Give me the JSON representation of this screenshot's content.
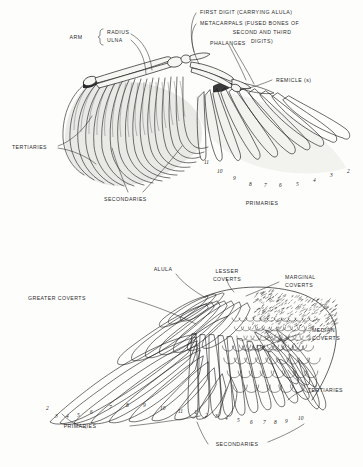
{
  "document": {
    "title": "Bird Wing Anatomy — Feather Tracts and Skeleton",
    "figure_count": 2,
    "ink_color": "#1d1d1d",
    "paper_color": "#fdfdfc"
  },
  "figures": [
    {
      "id": "upper-wing-skeleton",
      "caption": "Spread wing showing underlying skeleton and flight feathers",
      "labels": {
        "arm": "ARM",
        "radius": "RADIUS",
        "ulna": "ULNA",
        "first_digit": "FIRST DIGIT (CARRYING ALULA)",
        "metacarpals_line1": "METACARPALS (FUSED BONES OF",
        "metacarpals_line2": "SECOND AND THIRD",
        "metacarpals_line3": "DIGITS)",
        "phalanges": "PHALANGES",
        "remicle": "REMICLE (s)",
        "tertiaries": "TERTIARIES",
        "secondaries": "SECONDARIES",
        "primaries": "PRIMARIES"
      },
      "primary_numbers": [
        "11",
        "10",
        "9",
        "8",
        "7",
        "6",
        "5",
        "4",
        "3",
        "2"
      ]
    },
    {
      "id": "lower-wing-coverts",
      "caption": "Upper surface of wing showing covert feather tracts",
      "labels": {
        "alula": "ALULA",
        "lesser_coverts_line1": "LESSER",
        "lesser_coverts_line2": "COVERTS",
        "marginal_coverts_line1": "MARGINAL",
        "marginal_coverts_line2": "COVERTS",
        "greater_coverts": "GREATER  COVERTS",
        "median_coverts_line1": "MEDIAN",
        "median_coverts_line2": "COVERTS",
        "tertiaries": "TERTIARIES",
        "primaries": "PRIMARIES",
        "secondaries": "SECONDARIES"
      },
      "primary_numbers": [
        "2",
        "3",
        "4",
        "5",
        "6",
        "7",
        "8",
        "9",
        "10",
        "11"
      ],
      "secondary_numbers": [
        "1",
        "2",
        "3",
        "4",
        "5",
        "6",
        "7",
        "8",
        "9",
        "10"
      ]
    }
  ]
}
